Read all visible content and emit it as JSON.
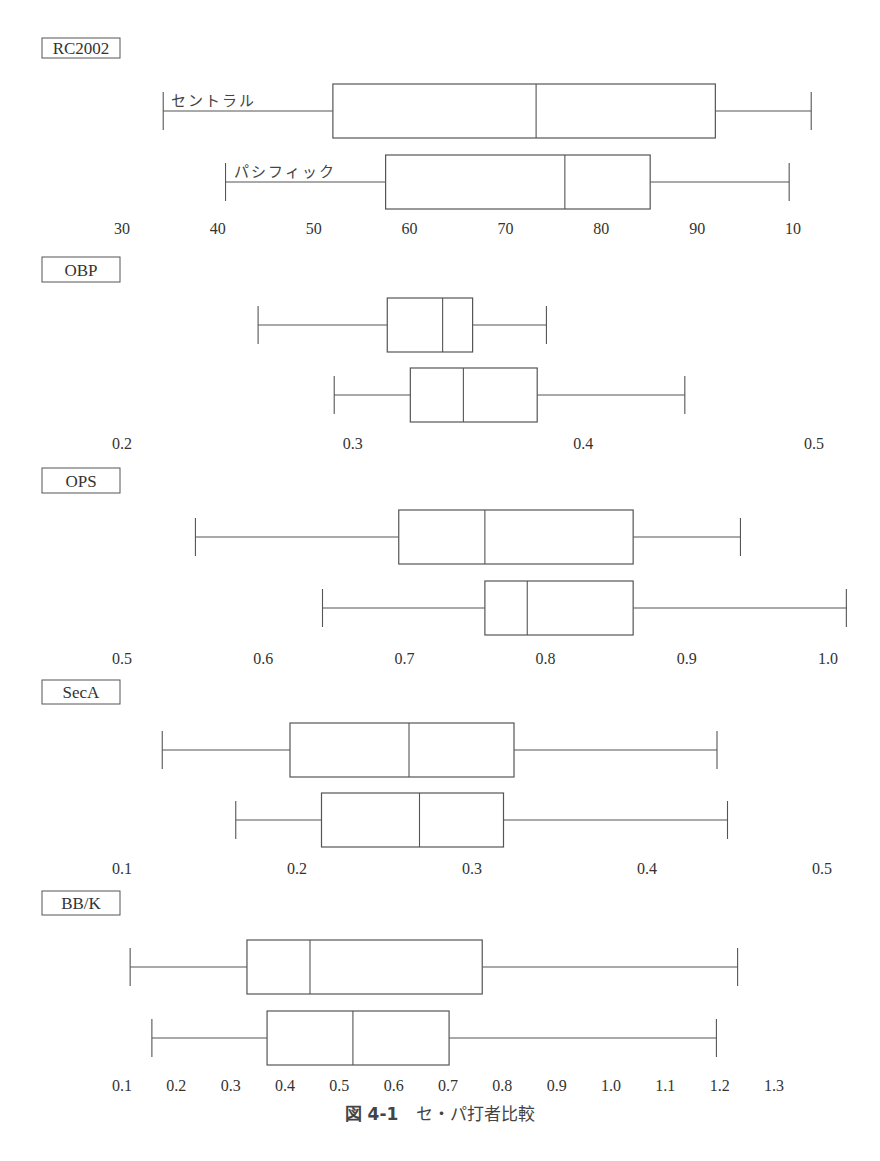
{
  "chart_data": [
    {
      "type": "box",
      "title": "RC2002",
      "orientation": "horizontal",
      "tick_labels": [
        "30",
        "40",
        "50",
        "60",
        "70",
        "80",
        "90",
        "10"
      ],
      "tick_values": [
        30,
        40,
        50,
        60,
        70,
        80,
        90,
        100
      ],
      "xlim": [
        30,
        100
      ],
      "series": [
        {
          "name": "セントラル",
          "min": 34.3,
          "q1": 52.0,
          "median": 73.2,
          "q3": 91.9,
          "max": 101.9
        },
        {
          "name": "パシフィック",
          "min": 40.8,
          "q1": 57.5,
          "median": 76.2,
          "q3": 85.1,
          "max": 99.6
        }
      ]
    },
    {
      "type": "box",
      "title": "OBP",
      "orientation": "horizontal",
      "tick_labels": [
        "0.2",
        "0.3",
        "0.4",
        "0.5"
      ],
      "tick_values": [
        0.2,
        0.3,
        0.4,
        0.5
      ],
      "xlim": [
        0.2,
        0.5
      ],
      "series": [
        {
          "name": "セントラル",
          "min": 0.259,
          "q1": 0.315,
          "median": 0.339,
          "q3": 0.352,
          "max": 0.384
        },
        {
          "name": "パシフィック",
          "min": 0.292,
          "q1": 0.325,
          "median": 0.348,
          "q3": 0.38,
          "max": 0.444
        }
      ]
    },
    {
      "type": "box",
      "title": "OPS",
      "orientation": "horizontal",
      "tick_labels": [
        "0.5",
        "0.6",
        "0.7",
        "0.8",
        "0.9",
        "1.0"
      ],
      "tick_values": [
        0.5,
        0.6,
        0.7,
        0.8,
        0.9,
        1.0
      ],
      "xlim": [
        0.5,
        1.0
      ],
      "series": [
        {
          "name": "セントラル",
          "min": 0.552,
          "q1": 0.696,
          "median": 0.757,
          "q3": 0.862,
          "max": 0.938
        },
        {
          "name": "パシフィック",
          "min": 0.642,
          "q1": 0.757,
          "median": 0.787,
          "q3": 0.862,
          "max": 1.013
        }
      ]
    },
    {
      "type": "box",
      "title": "SecA",
      "orientation": "horizontal",
      "tick_labels": [
        "0.1",
        "0.2",
        "0.3",
        "0.4",
        "0.5"
      ],
      "tick_values": [
        0.1,
        0.2,
        0.3,
        0.4,
        0.5
      ],
      "xlim": [
        0.1,
        0.5
      ],
      "series": [
        {
          "name": "セントラル",
          "min": 0.123,
          "q1": 0.196,
          "median": 0.264,
          "q3": 0.324,
          "max": 0.44
        },
        {
          "name": "パシフィック",
          "min": 0.165,
          "q1": 0.214,
          "median": 0.27,
          "q3": 0.318,
          "max": 0.446
        }
      ]
    },
    {
      "type": "box",
      "title": "BB/K",
      "orientation": "horizontal",
      "tick_labels": [
        "0.1",
        "0.2",
        "0.3",
        "0.4",
        "0.5",
        "0.6",
        "0.7",
        "0.8",
        "0.9",
        "1.0",
        "1.1",
        "1.2",
        "1.3"
      ],
      "tick_values": [
        0.1,
        0.2,
        0.3,
        0.4,
        0.5,
        0.6,
        0.7,
        0.8,
        0.9,
        1.0,
        1.1,
        1.2,
        1.3
      ],
      "xlim": [
        0.1,
        1.3
      ],
      "series": [
        {
          "name": "セントラル",
          "min": 0.115,
          "q1": 0.33,
          "median": 0.446,
          "q3": 0.763,
          "max": 1.233
        },
        {
          "name": "パシフィック",
          "min": 0.155,
          "q1": 0.367,
          "median": 0.525,
          "q3": 0.702,
          "max": 1.194
        }
      ]
    }
  ],
  "league_labels": {
    "central": "セントラル",
    "pacific": "パシフィック"
  },
  "caption": {
    "figure_number": "図 4-1",
    "title": "セ・パ打者比較"
  },
  "colors": {
    "line": "#555555",
    "text": "#333333",
    "background": "#ffffff"
  }
}
